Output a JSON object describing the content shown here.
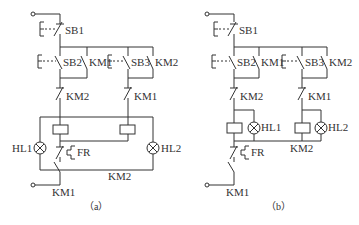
{
  "figure": {
    "type": "electrical control circuit schematic",
    "subfigures": [
      {
        "caption": "（a）",
        "labels": {
          "stop_button": "SB1",
          "start_button_1": "SB2",
          "hold_contact_1": "KM1",
          "start_button_2": "SB3",
          "hold_contact_2": "KM2",
          "interlock_1": "KM2",
          "interlock_2": "KM1",
          "lamp_1": "HL1",
          "lamp_2": "HL2",
          "overload": "FR",
          "bottom_contact_km2": "KM2",
          "bottom_contact_km1": "KM1"
        }
      },
      {
        "caption": "（b）",
        "labels": {
          "stop_button": "SB1",
          "start_button_1": "SB2",
          "hold_contact_1": "KM1",
          "start_button_2": "SB3",
          "hold_contact_2": "KM2",
          "interlock_1": "KM2",
          "interlock_2": "KM1",
          "lamp_1": "HL1",
          "lamp_2": "HL2",
          "overload": "FR",
          "bus_label": "KM2",
          "bottom_contact_km1": "KM1"
        }
      }
    ],
    "colors": {
      "line": "#333333",
      "background": "#ffffff"
    }
  }
}
